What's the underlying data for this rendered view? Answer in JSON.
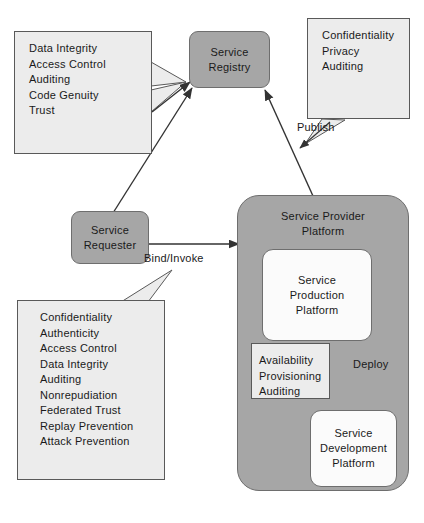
{
  "diagram": {
    "colors": {
      "process_fill": "#a6a6a6",
      "process_stroke": "#6e6e6e",
      "note_fill": "#ececec",
      "note_stroke": "#595959",
      "inner_fill": "#fbfbfb",
      "background": "#ffffff",
      "text": "#1a1a1a",
      "arrow": "#333333"
    },
    "nodes": {
      "registry": {
        "label": "Service\nRegistry",
        "type": "rounded-process"
      },
      "requester": {
        "label": "Service\nRequester",
        "type": "rounded-process"
      },
      "provider_platform": {
        "label": "Service Provider\nPlatform",
        "type": "container"
      },
      "production_platform": {
        "label": "Service\nProduction\nPlatform",
        "type": "rounded-inner"
      },
      "development_platform": {
        "label": "Service\nDevelopment\nPlatform",
        "type": "rounded-inner"
      }
    },
    "notes": {
      "registry_requirements": {
        "items": [
          "Data Integrity",
          "Access Control",
          "Auditing",
          "Code Genuity",
          "Trust"
        ]
      },
      "publish_requirements": {
        "items": [
          "Confidentiality",
          "Privacy",
          "Auditing"
        ]
      },
      "bind_invoke_requirements": {
        "items": [
          "Confidentiality",
          "Authenticity",
          "Access Control",
          "Data Integrity",
          "Auditing",
          "Nonrepudiation",
          "Federated Trust",
          "Replay Prevention",
          "Attack Prevention"
        ]
      },
      "deploy_requirements": {
        "items": [
          "Availability",
          "Provisioning",
          "Auditing"
        ]
      }
    },
    "edge_labels": {
      "publish": "Publish",
      "bind_invoke": "Bind/Invoke",
      "deploy": "Deploy"
    }
  }
}
